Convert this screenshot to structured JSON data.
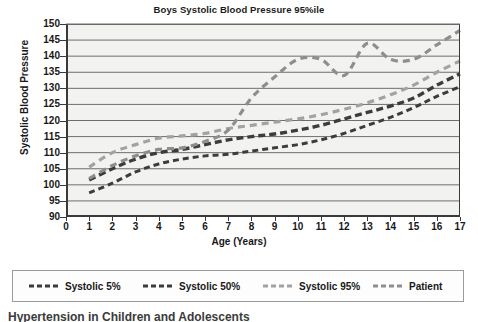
{
  "chart_data": {
    "type": "line",
    "title": "Boys Systolic Blood Pressure 95%ile",
    "xlabel": "Age (Years)",
    "ylabel": "Systolic Blood Pressure",
    "xlim": [
      0,
      17
    ],
    "ylim": [
      90,
      150
    ],
    "xticks": [
      0,
      1,
      2,
      3,
      4,
      5,
      6,
      7,
      8,
      9,
      10,
      11,
      12,
      13,
      14,
      15,
      16,
      17
    ],
    "yticks": [
      90,
      95,
      100,
      105,
      110,
      115,
      120,
      125,
      130,
      135,
      140,
      145,
      150
    ],
    "grid": "horizontal",
    "legend_position": "below",
    "x": [
      1,
      2,
      3,
      4,
      5,
      6,
      7,
      8,
      9,
      10,
      11,
      12,
      13,
      14,
      15,
      16,
      17
    ],
    "series": [
      {
        "name": "Systolic 5%",
        "color": "#3c3c3c",
        "dash": "6,4",
        "width": 3,
        "values": [
          97.5,
          100.5,
          104.0,
          106.5,
          108.0,
          109.0,
          109.5,
          110.5,
          111.5,
          112.5,
          114.0,
          116.0,
          118.5,
          121.0,
          124.0,
          127.5,
          130.5
        ]
      },
      {
        "name": "Systolic 50%",
        "color": "#3c3c3c",
        "dash": "7,4",
        "width": 3.4,
        "values": [
          101.5,
          105.0,
          108.0,
          110.0,
          111.0,
          112.5,
          114.0,
          115.0,
          115.8,
          117.0,
          118.5,
          120.5,
          122.5,
          124.5,
          127.0,
          131.0,
          134.5
        ]
      },
      {
        "name": "Systolic 95%",
        "color": "#a2a2a2",
        "dash": "7,5",
        "width": 3.2,
        "values": [
          105.5,
          110.0,
          112.5,
          114.5,
          115.2,
          116.0,
          117.5,
          118.5,
          119.5,
          120.5,
          121.8,
          123.5,
          125.5,
          128.0,
          131.0,
          135.0,
          138.5
        ]
      },
      {
        "name": "Patient",
        "color": "#8e8e8e",
        "dash": "7,5",
        "width": 3.2,
        "values": [
          102.0,
          106.0,
          109.0,
          111.0,
          111.5,
          113.5,
          117.0,
          127.0,
          133.5,
          139.0,
          139.0,
          134.0,
          144.0,
          139.0,
          139.0,
          143.5,
          148.0
        ]
      }
    ]
  },
  "legend": {
    "items": [
      {
        "label": "Systolic 5%",
        "color": "#3c3c3c"
      },
      {
        "label": "Systolic 50%",
        "color": "#3c3c3c"
      },
      {
        "label": "Systolic 95%",
        "color": "#a2a2a2"
      },
      {
        "label": "Patient",
        "color": "#8e8e8e"
      }
    ]
  },
  "bottom_caption": "Hypertension in Children and Adolescents"
}
